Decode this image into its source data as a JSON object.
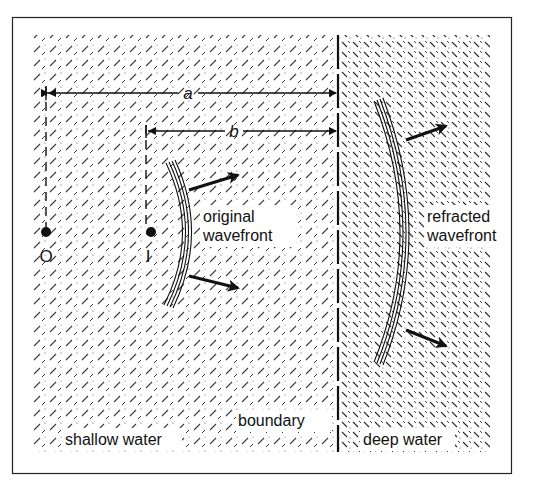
{
  "diagram": {
    "labels": {
      "distance_a": "a",
      "distance_b": "b",
      "object_point": "O",
      "image_point": "I",
      "original_wavefront_line1": "original",
      "original_wavefront_line2": "wavefront",
      "refracted_wavefront_line1": "refracted",
      "refracted_wavefront_line2": "wavefront",
      "boundary": "boundary",
      "shallow_region": "shallow water",
      "deep_region": "deep water"
    },
    "colors": {
      "ink": "#111111",
      "background": "#ffffff",
      "hatch": "#333333"
    }
  }
}
